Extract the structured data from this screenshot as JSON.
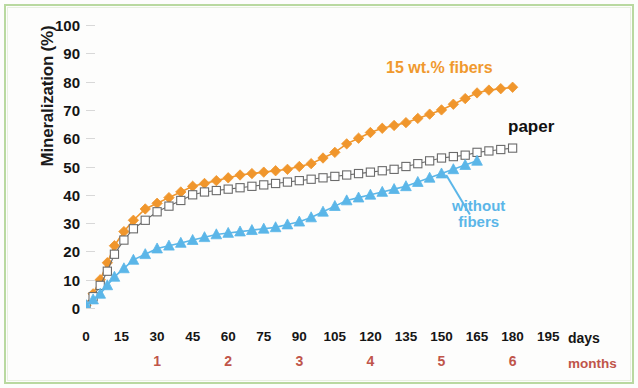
{
  "figure": {
    "border_color": "#b9d9a0",
    "background": "#fdfdfc"
  },
  "axes": {
    "y_title": "Mineralization (%)",
    "y_ticks": [
      0,
      10,
      20,
      30,
      40,
      50,
      60,
      70,
      80,
      90,
      100
    ],
    "x_ticks": [
      0,
      15,
      30,
      45,
      60,
      75,
      90,
      105,
      120,
      135,
      150,
      165,
      180,
      195
    ],
    "x_unit_label": "days",
    "month_ticks": [
      1,
      2,
      3,
      4,
      5,
      6
    ],
    "month_tick_days": [
      30,
      60,
      90,
      120,
      150,
      180
    ],
    "month_unit_label": "months",
    "month_color": "#c0554a"
  },
  "annotations": {
    "fibers": "15 wt.% fibers",
    "paper": "paper",
    "without_fibers": "without\nfibers"
  },
  "chart_data": {
    "type": "line",
    "title": "",
    "xlabel": "days",
    "ylabel": "Mineralization (%)",
    "xlim": [
      0,
      200
    ],
    "ylim": [
      0,
      100
    ],
    "grid": true,
    "legend_position": "inline-annotations",
    "secondary_x_axis": {
      "label": "months",
      "ticks": [
        1,
        2,
        3,
        4,
        5,
        6
      ],
      "tick_days": [
        30,
        60,
        90,
        120,
        150,
        180
      ]
    },
    "series": [
      {
        "name": "15 wt.% fibers",
        "color": "#f0962c",
        "marker": "diamond",
        "marker_fill": "#f0962c",
        "x": [
          0,
          3,
          6,
          9,
          12,
          16,
          20,
          25,
          30,
          35,
          40,
          45,
          50,
          55,
          60,
          65,
          70,
          75,
          80,
          85,
          90,
          95,
          100,
          105,
          110,
          115,
          120,
          125,
          130,
          135,
          140,
          145,
          150,
          155,
          160,
          165,
          170,
          175,
          180
        ],
        "y": [
          1,
          5,
          10,
          16,
          22,
          27,
          31,
          35,
          37,
          39,
          41,
          43,
          44,
          45,
          46,
          47,
          47.5,
          48,
          48.5,
          49,
          50,
          51,
          53,
          55,
          58,
          60,
          62,
          63.5,
          64.5,
          65.5,
          67,
          68.5,
          70,
          72,
          74,
          76,
          77,
          77.5,
          78
        ]
      },
      {
        "name": "paper",
        "color": "#6b6b6b",
        "marker": "square",
        "marker_fill": "#ffffff",
        "x": [
          0,
          3,
          6,
          9,
          12,
          16,
          20,
          25,
          30,
          35,
          40,
          45,
          50,
          55,
          60,
          65,
          70,
          75,
          80,
          85,
          90,
          95,
          100,
          105,
          110,
          115,
          120,
          125,
          130,
          135,
          140,
          145,
          150,
          155,
          160,
          165,
          170,
          175,
          180
        ],
        "y": [
          1,
          4,
          8,
          13,
          19,
          24,
          28,
          31,
          34,
          36,
          38,
          40,
          41,
          41.5,
          42,
          42.5,
          43,
          43.5,
          44,
          44.5,
          45,
          45.5,
          46,
          46.5,
          47,
          47.5,
          48,
          48.5,
          49,
          50,
          51,
          52,
          53,
          53.5,
          54,
          55,
          55.5,
          56,
          56.5
        ]
      },
      {
        "name": "without fibers",
        "color": "#5bb6e8",
        "marker": "triangle",
        "marker_fill": "#5bb6e8",
        "x": [
          0,
          3,
          6,
          9,
          12,
          16,
          20,
          25,
          30,
          35,
          40,
          45,
          50,
          55,
          60,
          65,
          70,
          75,
          80,
          85,
          90,
          95,
          100,
          105,
          110,
          115,
          120,
          125,
          130,
          135,
          140,
          145,
          150,
          155,
          160,
          165
        ],
        "y": [
          1,
          3,
          5,
          8,
          11,
          14,
          17,
          19,
          21,
          22,
          23,
          24,
          25,
          26,
          26.5,
          27,
          27.5,
          28,
          28.5,
          29.5,
          30.5,
          32,
          34,
          36,
          38,
          39,
          40,
          41,
          42,
          43,
          44.5,
          46,
          47.5,
          49,
          50.5,
          52
        ]
      }
    ]
  }
}
